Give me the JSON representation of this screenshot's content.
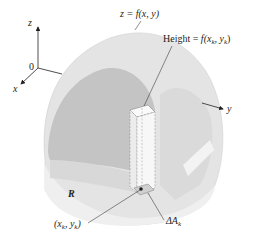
{
  "diagram": {
    "axes": {
      "z_label": "z",
      "x_label": "x",
      "y_label": "y",
      "origin_label": "0"
    },
    "labels": {
      "surface": "z = f(x, y)",
      "height_prefix": "Height = ",
      "height_expr": "f(x",
      "height_sub1": "k",
      "height_mid": ", y",
      "height_sub2": "k",
      "height_end": ")",
      "region": "R",
      "point_open": "(x",
      "point_sub1": "k",
      "point_mid": ", y",
      "point_sub2": "k",
      "point_close": ")",
      "area_delta": "ΔA",
      "area_sub": "k"
    },
    "colors": {
      "outer_surface": "#e6e6e6",
      "inner_dark": "#bdbdbd",
      "inner_mid": "#cfcfcf",
      "base_light": "#ececec",
      "column": "#f4f4f4",
      "ink": "#231f20"
    }
  }
}
